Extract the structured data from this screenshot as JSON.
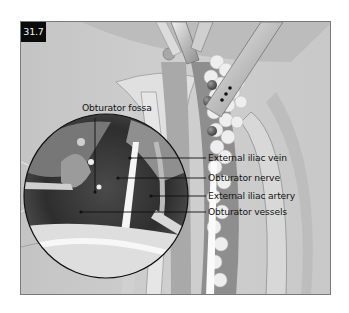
{
  "figure": {
    "number": "31.7",
    "colors": {
      "background": "#c9c9c9",
      "frame": "#7a7a7a",
      "badge_bg": "#0b0b0b",
      "badge_text": "#f2f2f2",
      "label_text": "#141414",
      "leader_line": "#111111"
    }
  },
  "labels": {
    "obturator_fossa": "Obturator fossa",
    "external_iliac_vein": "External iliac vein",
    "obturator_nerve": "Obturator nerve",
    "external_iliac_artery": "External iliac artery",
    "obturator_vessels": "Obturator vessels"
  }
}
